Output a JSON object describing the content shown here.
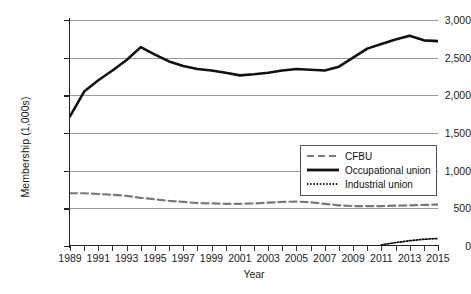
{
  "chart_data": {
    "type": "line",
    "title": "",
    "xlabel": "Year",
    "ylabel": "Membership (1,000s)",
    "xlim": [
      1989,
      2015
    ],
    "ylim": [
      0,
      3000
    ],
    "ytick_labels": [
      "0",
      "500",
      "1,000",
      "1,500",
      "2,000",
      "2,500",
      "3,000"
    ],
    "ytick_values": [
      0,
      500,
      1000,
      1500,
      2000,
      2500,
      3000
    ],
    "xtick_labels": [
      "1989",
      "1991",
      "1993",
      "1995",
      "1997",
      "1999",
      "2001",
      "2003",
      "2005",
      "2007",
      "2009",
      "2011",
      "2013",
      "2015"
    ],
    "xtick_values": [
      1989,
      1991,
      1993,
      1995,
      1997,
      1999,
      2001,
      2003,
      2005,
      2007,
      2009,
      2011,
      2013,
      2015
    ],
    "x": [
      1989,
      1990,
      1991,
      1992,
      1993,
      1994,
      1995,
      1996,
      1997,
      1998,
      1999,
      2000,
      2001,
      2002,
      2003,
      2004,
      2005,
      2006,
      2007,
      2008,
      2009,
      2010,
      2011,
      2012,
      2013,
      2014,
      2015
    ],
    "grid": "horizontal",
    "legend_position": "lower-right",
    "series": [
      {
        "name": "CFBU",
        "style": "dashed",
        "color": "#7a7a7a",
        "values": [
          700,
          700,
          690,
          680,
          665,
          640,
          620,
          600,
          585,
          570,
          565,
          560,
          560,
          565,
          575,
          585,
          590,
          580,
          560,
          540,
          530,
          530,
          530,
          535,
          540,
          545,
          550
        ]
      },
      {
        "name": "Occupational union",
        "style": "solid",
        "color": "#111111",
        "values": [
          1720,
          2050,
          2200,
          2330,
          2470,
          2640,
          2540,
          2450,
          2390,
          2350,
          2330,
          2300,
          2265,
          2280,
          2300,
          2330,
          2350,
          2340,
          2330,
          2380,
          2500,
          2620,
          2680,
          2740,
          2790,
          2730,
          2720
        ]
      },
      {
        "name": "Industrial union",
        "style": "dotted",
        "color": "#111111",
        "values": [
          null,
          null,
          null,
          null,
          null,
          null,
          null,
          null,
          null,
          null,
          null,
          null,
          null,
          null,
          null,
          null,
          null,
          null,
          null,
          null,
          null,
          null,
          15,
          45,
          70,
          90,
          100
        ]
      }
    ]
  },
  "legend": {
    "items": [
      {
        "label": "CFBU"
      },
      {
        "label": "Occupational union"
      },
      {
        "label": "Industrial union"
      }
    ]
  }
}
